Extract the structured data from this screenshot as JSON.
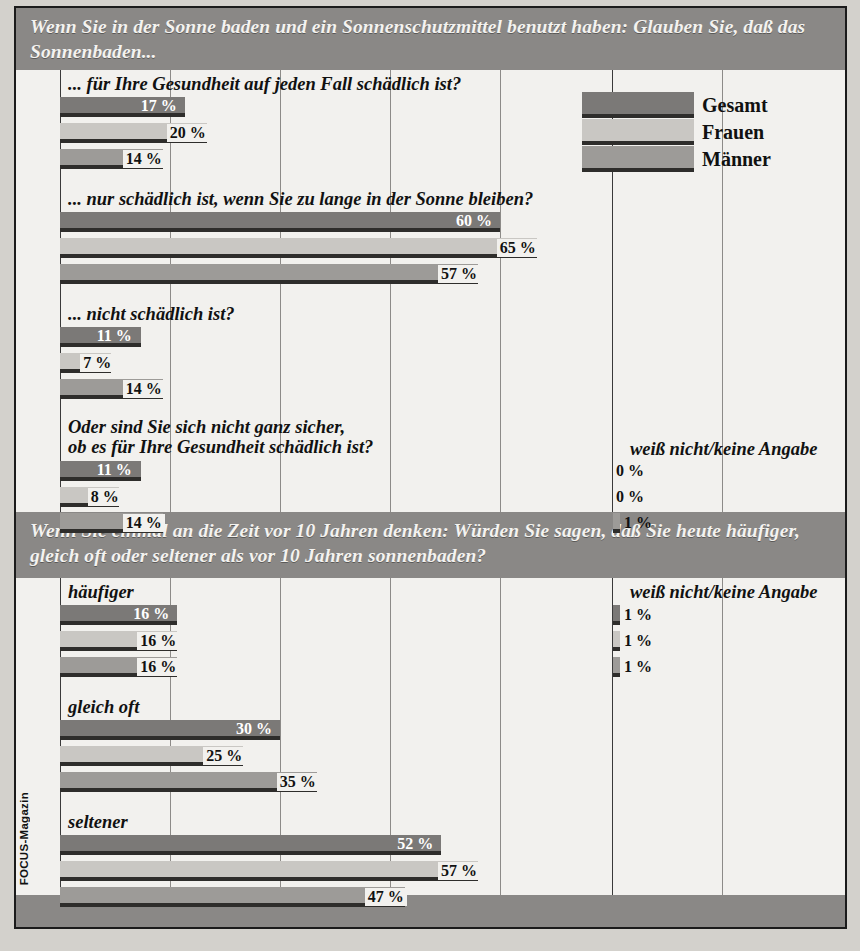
{
  "source": "FOCUS-Magazin",
  "colors": {
    "header_bg": "#8a8886",
    "plot_bg": "#f2f1ee",
    "series_gesamt": "#7b7977",
    "series_frauen": "#c9c7c3",
    "series_maenner": "#9d9b98",
    "gridline": "#8d8b88",
    "text": "#111111"
  },
  "legend": {
    "items": [
      {
        "label": "Gesamt",
        "color": "#7b7977"
      },
      {
        "label": "Frauen",
        "color": "#c9c7c3"
      },
      {
        "label": "Männer",
        "color": "#9d9b98"
      }
    ]
  },
  "secondary_label": "weiß nicht/keine Angabe",
  "chart_data": [
    {
      "type": "bar",
      "orientation": "horizontal",
      "title": "Wenn Sie in der Sonne baden und ein Sonnenschutzmittel benutzt haben:\nGlauben Sie, daß das Sonnenbaden...",
      "series": [
        {
          "name": "Gesamt",
          "color": "#7b7977"
        },
        {
          "name": "Frauen",
          "color": "#c9c7c3"
        },
        {
          "name": "Männer",
          "color": "#9d9b98"
        }
      ],
      "categories": [
        "... für Ihre Gesundheit auf jeden Fall schädlich ist?",
        "... nur schädlich ist, wenn Sie zu lange in der Sonne bleiben?",
        "... nicht schädlich ist?",
        "Oder sind Sie sich nicht ganz sicher,\nob es für Ihre Gesundheit schädlich ist?"
      ],
      "values": [
        [
          17,
          20,
          14
        ],
        [
          60,
          65,
          57
        ],
        [
          11,
          7,
          14
        ],
        [
          11,
          8,
          14
        ]
      ],
      "value_labels": [
        [
          "17 %",
          "20 %",
          "14 %"
        ],
        [
          "60 %",
          "65 %",
          "57 %"
        ],
        [
          "11 %",
          "7 %",
          "14 %"
        ],
        [
          "11 %",
          "8 %",
          "14 %"
        ]
      ],
      "secondary": {
        "label": "weiß nicht/keine Angabe",
        "group_index": 3,
        "values": [
          0,
          0,
          1
        ],
        "value_labels": [
          "0 %",
          "0 %",
          "1 %"
        ]
      },
      "xlim": [
        0,
        75
      ],
      "grid_ticks": [
        0,
        15,
        30,
        45,
        60
      ],
      "grid": true,
      "legend_position": "top-right",
      "xlabel": "",
      "ylabel": ""
    },
    {
      "type": "bar",
      "orientation": "horizontal",
      "title": "Wenn Sie einmal an die Zeit vor 10 Jahren denken: Würden Sie sagen, daß Sie\nheute häufiger, gleich oft oder seltener als vor 10 Jahren sonnenbaden?",
      "series": [
        {
          "name": "Gesamt",
          "color": "#7b7977"
        },
        {
          "name": "Frauen",
          "color": "#c9c7c3"
        },
        {
          "name": "Männer",
          "color": "#9d9b98"
        }
      ],
      "categories": [
        "häufiger",
        "gleich oft",
        "seltener"
      ],
      "values": [
        [
          16,
          16,
          16
        ],
        [
          30,
          25,
          35
        ],
        [
          52,
          57,
          47
        ]
      ],
      "value_labels": [
        [
          "16 %",
          "16 %",
          "16 %"
        ],
        [
          "30 %",
          "25 %",
          "35 %"
        ],
        [
          "52 %",
          "57 %",
          "47 %"
        ]
      ],
      "secondary": {
        "label": "weiß nicht/keine Angabe",
        "group_index": 0,
        "values": [
          1,
          1,
          1
        ],
        "value_labels": [
          "1 %",
          "1 %",
          "1 %"
        ]
      },
      "xlim": [
        0,
        75
      ],
      "grid_ticks": [
        0,
        15,
        30,
        45,
        60
      ],
      "grid": true,
      "legend_position": "none",
      "xlabel": "",
      "ylabel": ""
    }
  ]
}
